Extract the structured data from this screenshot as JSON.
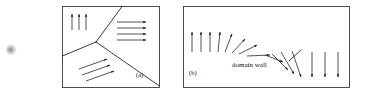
{
  "figure": {
    "background_color": "#ffffff",
    "stroke_color": "#1a1a1a",
    "panels": [
      {
        "id": "a",
        "caption": "(a)",
        "description": "three magnetic domains separated by a Y-shaped domain boundary",
        "frame": {
          "x": 62,
          "y": 6,
          "width": 98,
          "height": 82
        },
        "boundary": {
          "type": "y-junction",
          "junction_point": [
            96,
            42
          ],
          "branch_endpoints": [
            [
              122,
              6
            ],
            [
              62,
              55
            ],
            [
              160,
              85
            ]
          ]
        },
        "arrow_groups": [
          {
            "name": "up-domain",
            "direction_deg": 270,
            "count": 3,
            "arrows": [
              {
                "x1": 72,
                "y1": 30,
                "x2": 72,
                "y2": 13
              },
              {
                "x1": 79,
                "y1": 30,
                "x2": 79,
                "y2": 13
              },
              {
                "x1": 86,
                "y1": 30,
                "x2": 86,
                "y2": 13
              }
            ]
          },
          {
            "name": "right-domain",
            "direction_deg": 0,
            "count": 4,
            "arrows": [
              {
                "x1": 117,
                "y1": 22,
                "x2": 148,
                "y2": 22
              },
              {
                "x1": 117,
                "y1": 28,
                "x2": 148,
                "y2": 28
              },
              {
                "x1": 117,
                "y1": 34,
                "x2": 148,
                "y2": 34
              },
              {
                "x1": 117,
                "y1": 40,
                "x2": 148,
                "y2": 40
              }
            ]
          },
          {
            "name": "diagonal-domain",
            "direction_deg": 330,
            "count": 3,
            "arrows": [
              {
                "x1": 79,
                "y1": 69,
                "x2": 108,
                "y2": 59
              },
              {
                "x1": 82,
                "y1": 75,
                "x2": 111,
                "y2": 65
              },
              {
                "x1": 86,
                "y1": 81,
                "x2": 115,
                "y2": 71
              }
            ]
          }
        ]
      },
      {
        "id": "b",
        "caption": "(b)",
        "description": "Bloch domain wall showing gradual spin rotation from up through horizontal to down",
        "frame": {
          "x": 183,
          "y": 6,
          "width": 167,
          "height": 82
        },
        "annotation": {
          "text": "domain wall",
          "x": 232,
          "y": 62,
          "pointer": {
            "x1": 288,
            "y1": 60,
            "x2": 300,
            "y2": 51
          }
        },
        "arrow_sequence": {
          "count": 15,
          "angles_deg": [
            270,
            270,
            270,
            276,
            292,
            308,
            330,
            352,
            20,
            42,
            60,
            76,
            90,
            90,
            90
          ],
          "arrows": [
            {
              "x1": 192,
              "y1": 52,
              "x2": 192,
              "y2": 31,
              "angle_deg": 270
            },
            {
              "x1": 201,
              "y1": 52,
              "x2": 201,
              "y2": 31,
              "angle_deg": 270
            },
            {
              "x1": 210,
              "y1": 52,
              "x2": 210,
              "y2": 31,
              "angle_deg": 270
            },
            {
              "x1": 218,
              "y1": 52,
              "x2": 220,
              "y2": 31,
              "angle_deg": 276
            },
            {
              "x1": 226,
              "y1": 52,
              "x2": 233,
              "y2": 33,
              "angle_deg": 292
            },
            {
              "x1": 234,
              "y1": 52,
              "x2": 247,
              "y2": 38,
              "angle_deg": 312
            },
            {
              "x1": 240,
              "y1": 54,
              "x2": 258,
              "y2": 46,
              "angle_deg": 336
            },
            {
              "x1": 247,
              "y1": 55,
              "x2": 270,
              "y2": 55,
              "angle_deg": 0
            },
            {
              "x1": 265,
              "y1": 55,
              "x2": 284,
              "y2": 62,
              "angle_deg": 20
            },
            {
              "x1": 272,
              "y1": 54,
              "x2": 289,
              "y2": 70,
              "angle_deg": 44
            },
            {
              "x1": 280,
              "y1": 52,
              "x2": 296,
              "y2": 74,
              "angle_deg": 54
            },
            {
              "x1": 291,
              "y1": 50,
              "x2": 302,
              "y2": 77,
              "angle_deg": 68
            },
            {
              "x1": 312,
              "y1": 52,
              "x2": 312,
              "y2": 78,
              "angle_deg": 90
            },
            {
              "x1": 325,
              "y1": 52,
              "x2": 325,
              "y2": 78,
              "angle_deg": 90
            },
            {
              "x1": 338,
              "y1": 52,
              "x2": 338,
              "y2": 78,
              "angle_deg": 90
            }
          ]
        }
      }
    ],
    "artifact": {
      "name": "scan-smudge",
      "x": 6,
      "y": 44,
      "width": 11,
      "height": 11
    }
  }
}
